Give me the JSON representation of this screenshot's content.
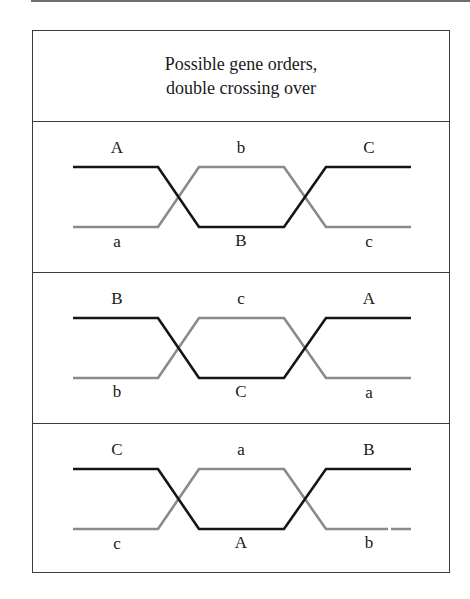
{
  "title": {
    "line1": "Possible gene orders,",
    "line2": "double crossing over"
  },
  "colors": {
    "chromatid_dark": "#151515",
    "chromatid_light": "#8a8a8a",
    "border": "#3a3a3a"
  },
  "panels": [
    {
      "top_labels": [
        "A",
        "b",
        "C"
      ],
      "bottom_labels": [
        "a",
        "B",
        "c"
      ]
    },
    {
      "top_labels": [
        "B",
        "c",
        "A"
      ],
      "bottom_labels": [
        "b",
        "C",
        "a"
      ]
    },
    {
      "top_labels": [
        "C",
        "a",
        "B"
      ],
      "bottom_labels": [
        "c",
        "A",
        "b"
      ]
    }
  ]
}
